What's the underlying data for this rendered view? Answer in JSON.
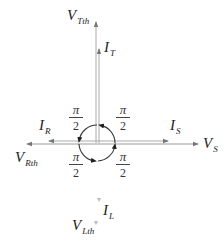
{
  "diagram": {
    "type": "phasor-diagram",
    "colors": {
      "axis": "#999999",
      "circle": "#333333",
      "text": "#222222"
    },
    "labels": {
      "v_top": {
        "main": "V",
        "sub": "Tth"
      },
      "i_top": {
        "main": "I",
        "sub": "T"
      },
      "i_left": {
        "main": "I",
        "sub": "R"
      },
      "i_right": {
        "main": "I",
        "sub": "S"
      },
      "v_right": {
        "main": "V",
        "sub": "S"
      },
      "v_left": {
        "main": "V",
        "sub": "Rth"
      },
      "i_bottom": {
        "main": "I",
        "sub": "L"
      },
      "v_bottom": {
        "main": "V",
        "sub": "Lth"
      }
    },
    "angles": [
      {
        "num": "π",
        "den": "2",
        "position": "upper-left"
      },
      {
        "num": "π",
        "den": "2",
        "position": "upper-right"
      },
      {
        "num": "π",
        "den": "2",
        "position": "lower-left"
      },
      {
        "num": "π",
        "den": "2",
        "position": "lower-right"
      }
    ]
  }
}
